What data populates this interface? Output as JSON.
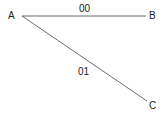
{
  "diagram": {
    "nodes": [
      {
        "id": "A",
        "label": "A"
      },
      {
        "id": "B",
        "label": "B"
      },
      {
        "id": "C",
        "label": "C"
      }
    ],
    "edges": [
      {
        "from": "A",
        "to": "B",
        "label": "00"
      },
      {
        "from": "A",
        "to": "C",
        "label": "01"
      }
    ],
    "colors": {
      "line": "#6b6b6b",
      "text": "#222222",
      "background": "#ffffff"
    }
  }
}
